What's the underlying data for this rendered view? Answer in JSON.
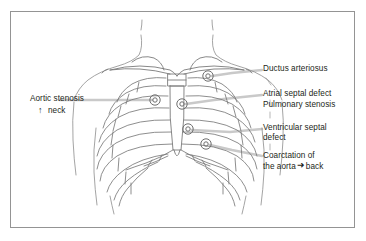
{
  "figure": {
    "type": "anatomical-diagram",
    "border_color": "#949494",
    "background_color": "#ffffff",
    "line_color": "#6f6f6f",
    "leader_color": "#c9c9c9",
    "text_color": "#231f20"
  },
  "labels": {
    "left": {
      "aortic_stenosis": "Aortic stenosis",
      "up_arrow": "↑",
      "neck": "neck"
    },
    "right": {
      "ductus_arteriosus": "Ductus arteriosus",
      "atrial_septal_defect": "Atrial septal defect",
      "pulmonary_stenosis": "Pulmonary stenosis",
      "ventricular_septal_defect_line1": "Ventricular septal",
      "ventricular_septal_defect_line2": "defect",
      "coarctation_line1": "Coarctation of",
      "coarctation_line2_pre": "the aorta",
      "coarctation_arrow": "➜",
      "coarctation_line2_post": "back"
    }
  },
  "markers": [
    {
      "name": "ductus-arteriosus-site",
      "x": 208,
      "y": 76
    },
    {
      "name": "aortic-stenosis-site",
      "x": 155,
      "y": 100
    },
    {
      "name": "pulmonary-stenosis-site",
      "x": 182,
      "y": 104
    },
    {
      "name": "ventricular-septal-defect-site",
      "x": 188,
      "y": 129
    },
    {
      "name": "coarctation-site",
      "x": 206,
      "y": 144
    }
  ]
}
